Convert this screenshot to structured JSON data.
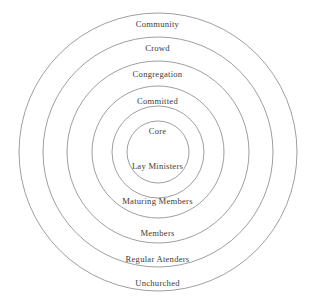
{
  "diagram": {
    "type": "concentric-circles",
    "background_color": "#ffffff",
    "stroke_color": "#8e8e8e",
    "text_color": "#2b2b2b",
    "center": {
      "x": 158,
      "y": 152
    },
    "rings": [
      {
        "id": "community",
        "top_label": "Community",
        "bottom_label": "Unchurched",
        "radius": 139,
        "top_label_y": 19,
        "bottom_label_y": 278
      },
      {
        "id": "crowd",
        "top_label": "Crowd",
        "bottom_label": "Regular Atenders",
        "radius": 115,
        "top_label_y": 43,
        "bottom_label_y": 254
      },
      {
        "id": "congregation",
        "top_label": "Congregation",
        "bottom_label": "Members",
        "radius": 91,
        "top_label_y": 69,
        "bottom_label_y": 228
      },
      {
        "id": "committed",
        "top_label": "Committed",
        "bottom_label": "Maturing Members",
        "radius": 66,
        "top_label_y": 96,
        "bottom_label_y": 196
      },
      {
        "id": "core",
        "top_label": "Core",
        "bottom_label": "Lay Ministers",
        "radius": 46,
        "top_label_y": 127,
        "bottom_label_y": 161
      },
      {
        "id": "innermost",
        "top_label": "",
        "bottom_label": "",
        "radius": 31,
        "top_label_y": 0,
        "bottom_label_y": 0
      }
    ]
  }
}
